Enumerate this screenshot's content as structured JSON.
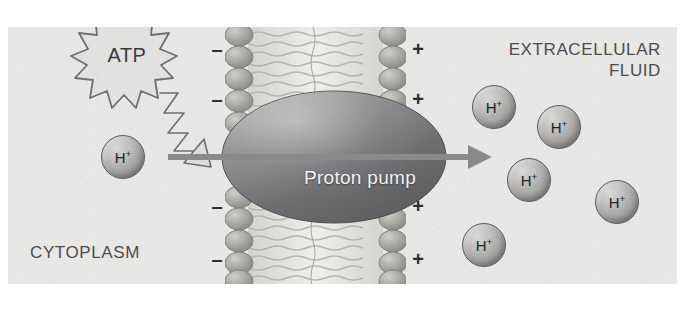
{
  "figure": {
    "background_color": "#e7e7e5",
    "frame": {
      "x": 8,
      "y": 27,
      "width": 669,
      "height": 257
    }
  },
  "labels": {
    "extracellular": "EXTRACELLULAR\nFLUID",
    "cytoplasm": "CYTOPLASM",
    "pump": "Proton pump",
    "atp": "ATP"
  },
  "ion_label": {
    "symbol": "H",
    "charge": "+"
  },
  "charges": {
    "negative_symbol": "–",
    "positive_symbol": "+",
    "negative": [
      {
        "x": 209,
        "y": 22
      },
      {
        "x": 209,
        "y": 72
      },
      {
        "x": 209,
        "y": 179
      },
      {
        "x": 209,
        "y": 232
      }
    ],
    "positive": [
      {
        "x": 410,
        "y": 22
      },
      {
        "x": 410,
        "y": 72
      },
      {
        "x": 410,
        "y": 179
      },
      {
        "x": 410,
        "y": 232
      }
    ]
  },
  "membrane": {
    "x": 217,
    "width": 181,
    "head_color": "#a3a39f",
    "tail_color": "#c9c9c5",
    "description": "phospholipid bilayer seen edge-on, heads on both outer faces"
  },
  "pump": {
    "cx": 326,
    "cy": 130,
    "rx": 112,
    "ry": 66,
    "fill_dark": "#6b6b6d",
    "fill_light": "#9b9b9c"
  },
  "transport_arrow": {
    "x1": 160,
    "y1": 130,
    "x2": 480,
    "y2": 130,
    "color": "#8a8a8c"
  },
  "energy_arrow": {
    "color": "#6f6f70",
    "fill": "#dededc",
    "description": "zigzag lightning arrow from ATP to the pump"
  },
  "atp_burst": {
    "cx": 119,
    "cy": 28,
    "points": 14,
    "outer_r": 48,
    "inner_r": 31,
    "fill": "#e2e2e0",
    "stroke": "#6f6f70"
  },
  "ions": [
    {
      "name": "ion-cytoplasm-1",
      "cx": 115,
      "cy": 130,
      "r": 21,
      "side": "cytoplasm"
    },
    {
      "name": "ion-extracellular-1",
      "cx": 486,
      "cy": 80,
      "r": 21,
      "side": "extracellular"
    },
    {
      "name": "ion-extracellular-2",
      "cx": 551,
      "cy": 100,
      "r": 21,
      "side": "extracellular"
    },
    {
      "name": "ion-extracellular-3",
      "cx": 521,
      "cy": 153,
      "r": 21,
      "side": "extracellular"
    },
    {
      "name": "ion-extracellular-4",
      "cx": 609,
      "cy": 175,
      "r": 21,
      "side": "extracellular"
    },
    {
      "name": "ion-extracellular-5",
      "cx": 476,
      "cy": 218,
      "r": 21,
      "side": "extracellular"
    }
  ]
}
